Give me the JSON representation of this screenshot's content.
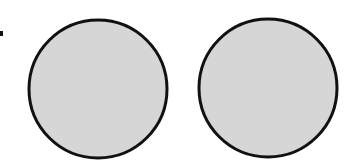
{
  "diagram": {
    "shapes": [
      {
        "id": "circle-left",
        "type": "circle",
        "fill": "#d6d6d6",
        "stroke": "#111111"
      },
      {
        "id": "circle-right",
        "type": "circle",
        "fill": "#d6d6d6",
        "stroke": "#111111"
      }
    ],
    "marker": {
      "type": "dot",
      "color": "#111111"
    },
    "colors": {
      "background": "#ffffff",
      "fill": "#d6d6d6",
      "outline": "#111111"
    }
  }
}
